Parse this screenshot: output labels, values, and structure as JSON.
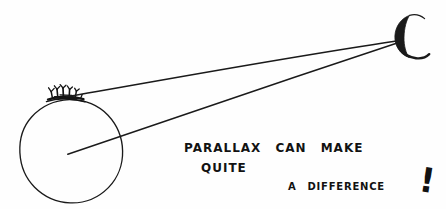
{
  "figure": {
    "medium": "hand-drawn line illustration",
    "background_color": "#fefefe",
    "ink_color": "#121212",
    "width": 446,
    "height": 209
  },
  "caption": {
    "line1": "Parallax can make",
    "line2": "Quite",
    "line3": "a difference",
    "exclamation": "!",
    "full_text": "PARALLAX CAN MAKE QUITE A DIFFERENCE!"
  },
  "scene": {
    "earth": {
      "label": "earth-circle",
      "center_x": 71,
      "center_y": 151,
      "radius": 51.5,
      "stroke_width": 1.3
    },
    "observers": {
      "label": "observer-figures",
      "description": "small scribbled figures standing on top of the earth",
      "anchor_x": 63,
      "anchor_y": 98
    },
    "moon": {
      "label": "crescent-moon",
      "center_x": 412,
      "center_y": 36,
      "outer_radius": 21,
      "opening": "right"
    },
    "sightlines": [
      {
        "name": "surface-sightline",
        "description": "line of sight from the observer on the earth's surface to the moon",
        "x1": 67,
        "y1": 97,
        "x2": 396,
        "y2": 41
      },
      {
        "name": "center-sightline",
        "description": "line of sight from the centre of the earth to the moon",
        "x1": 68,
        "y1": 154,
        "x2": 396,
        "y2": 43
      }
    ]
  }
}
